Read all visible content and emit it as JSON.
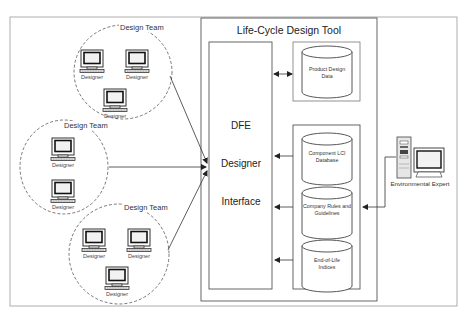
{
  "diagram": {
    "title": "Life-Cycle Design Tool",
    "colors": {
      "line": "#444444",
      "frame": "#999999",
      "background": "#ffffff",
      "screen_fill": "#f2f2f2"
    },
    "interface": {
      "lines": [
        "DFE",
        "Designer",
        "Interface"
      ]
    },
    "design_teams": [
      {
        "label": "Design Team",
        "designers": [
          "Designer",
          "Designer",
          "Designer"
        ]
      },
      {
        "label": "Design Team",
        "designers": [
          "Designer",
          "Designer"
        ]
      },
      {
        "label": "Design Team",
        "designers": [
          "Designer",
          "Designer",
          "Designer"
        ]
      }
    ],
    "databases": {
      "product": {
        "label": "Product Design Data"
      },
      "group": [
        {
          "label": "Component LCI Database"
        },
        {
          "label": "Company Rules and Guidelines"
        },
        {
          "label": "End-of-Life Indices"
        }
      ]
    },
    "external": {
      "label": "Environmental Expert"
    },
    "connections": [
      {
        "from": "Design Team 1",
        "to": "DFE Designer Interface",
        "arrow": "end"
      },
      {
        "from": "Design Team 2",
        "to": "DFE Designer Interface",
        "arrow": "end"
      },
      {
        "from": "Design Team 3",
        "to": "DFE Designer Interface",
        "arrow": "end"
      },
      {
        "from": "Product Design Data",
        "to": "DFE Designer Interface",
        "arrow": "both"
      },
      {
        "from": "Component LCI Database",
        "to": "DFE Designer Interface",
        "arrow": "end"
      },
      {
        "from": "Company Rules and Guidelines",
        "to": "DFE Designer Interface",
        "arrow": "end"
      },
      {
        "from": "End-of-Life Indices",
        "to": "DFE Designer Interface",
        "arrow": "end"
      },
      {
        "from": "Environmental Expert",
        "to": "Database group",
        "arrow": "end"
      }
    ]
  }
}
